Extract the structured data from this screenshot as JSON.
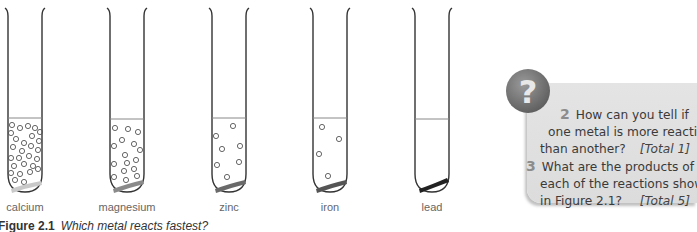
{
  "figure": {
    "tubes": [
      {
        "metal": "calcium",
        "bubbles": 30,
        "strip_color": "#c9c9c9"
      },
      {
        "metal": "magnesium",
        "bubbles": 17,
        "strip_color": "#8a8a8a"
      },
      {
        "metal": "zinc",
        "bubbles": 7,
        "strip_color": "#6a6a6a"
      },
      {
        "metal": "iron",
        "bubbles": 4,
        "strip_color": "#555555"
      },
      {
        "metal": "lead",
        "bubbles": 0,
        "strip_color": "#222222"
      }
    ],
    "caption_number": "Figure 2.1",
    "caption_text": "Which metal reacts fastest?"
  },
  "questions": {
    "icon": "question-mark-icon",
    "icon_glyph": "?",
    "items": [
      {
        "number": "2",
        "lines": [
          "How can you tell if",
          "one metal is more reactive",
          "than another?"
        ],
        "total": "[Total 1]"
      },
      {
        "number": "3",
        "lines": [
          "What are the products of",
          "each of the reactions shown",
          "in Figure 2.1?"
        ],
        "total": "[Total 5]"
      }
    ]
  }
}
